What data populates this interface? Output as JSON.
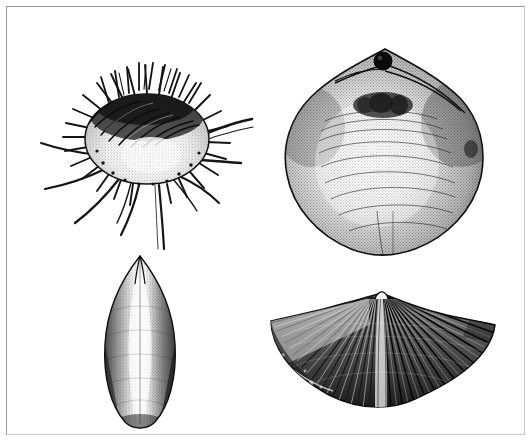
{
  "plate": {
    "title": "Fossil invertebrate specimen plate",
    "medium": "pen-and-ink stipple illustration",
    "background_color": "#ffffff",
    "frame_color": "#9a9a9a",
    "ink_color": "#111111",
    "width": 531,
    "height": 442,
    "caption": "",
    "plate_label": ""
  },
  "figures": [
    {
      "id": "fig-spinose-productid",
      "position": "upper-left",
      "label": "",
      "common_name": "spinose productid brachiopod",
      "description": "Globose valve densely covered with long hollow spines radiating in all directions; several elongate spines trail downward and to the right.",
      "center_x": 145,
      "center_y": 130,
      "body_rx": 64,
      "body_ry": 46,
      "spine_count": 46,
      "long_spine_count": 9,
      "features": [
        "spines",
        "spine-bases",
        "stippled-venter",
        "trail-spines"
      ]
    },
    {
      "id": "fig-smooth-terebratulid",
      "position": "upper-right",
      "label": "",
      "common_name": "smooth terebratulid brachiopod",
      "description": "Broad subpentagonal shell with smooth stippled surface, concentric growth lines, and a circular pedicle foramen piercing the beak at the apex.",
      "center_x": 378,
      "center_y": 148,
      "body_rx": 98,
      "body_ry": 97,
      "foramen_x": 375,
      "foramen_y": 51,
      "foramen_r": 7,
      "growth_line_count": 9,
      "features": [
        "pedicle-foramen",
        "beak",
        "growth-lines",
        "stipple-shading"
      ]
    },
    {
      "id": "fig-elongate-lingulid",
      "position": "lower-left",
      "label": "",
      "common_name": "elongate lingulid brachiopod",
      "description": "Narrow elongate-oval valve tapering to a pointed apex above and rounded below, with a faint median ridge and dark stippled lateral margins.",
      "center_x": 131,
      "center_y": 335,
      "body_rx": 36,
      "body_ry": 78,
      "features": [
        "pointed-apex",
        "median-ridge",
        "marginal-shading"
      ]
    },
    {
      "id": "fig-ribbed-spiriferid",
      "position": "lower-right",
      "label": "",
      "common_name": "ribbed spiriferid brachiopod",
      "description": "Transversely winged shell bearing strong radiating costae fanning from a raised median fold; left wing broken exposing the shell interior.",
      "center_x": 370,
      "center_y": 350,
      "half_width": 115,
      "half_height": 58,
      "rib_count": 46,
      "features": [
        "radiating-costae",
        "median-fold",
        "alate-extensions",
        "broken-margin",
        "growth-lines"
      ]
    }
  ]
}
